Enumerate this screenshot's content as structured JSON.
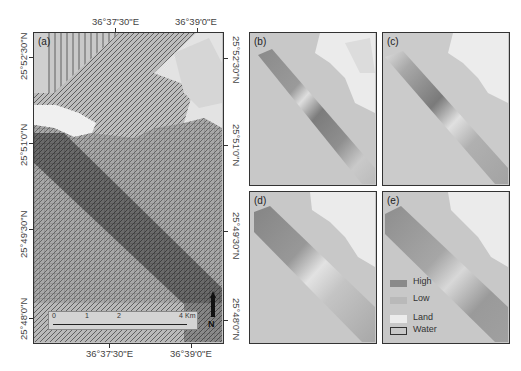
{
  "figure": {
    "panels": [
      {
        "id": "a",
        "label": "(a)"
      },
      {
        "id": "b",
        "label": "(b)"
      },
      {
        "id": "c",
        "label": "(c)"
      },
      {
        "id": "d",
        "label": "(d)"
      },
      {
        "id": "e",
        "label": "(e)"
      }
    ],
    "axes": {
      "top_x_ticks": [
        "36°37'30\"E",
        "36°39'0\"E"
      ],
      "bottom_x_ticks": [
        "36°37'30\"E",
        "36°39'0\"E"
      ],
      "left_y_ticks": [
        "25°52'30\"N",
        "25°51'0\"N",
        "25°49'30\"N",
        "25°48'0\"N"
      ],
      "right_y_ticks": [
        "25°52'30\"N",
        "25°51'0\"N",
        "25°49'30\"N",
        "25°48'0\"N"
      ]
    },
    "scale_bar": {
      "ticks": [
        "0",
        "1",
        "2",
        "4"
      ],
      "unit": "Km"
    },
    "north_arrow": {
      "label": "N"
    },
    "legend": {
      "items": [
        {
          "label": "High",
          "color": "#8a8a8a"
        },
        {
          "label": "Low",
          "color": "#b9b9b9"
        },
        {
          "label": "Land",
          "color": "#ececec"
        },
        {
          "label": "Water",
          "color": "#c8c8c8"
        }
      ]
    },
    "colors": {
      "land": "#ececec",
      "water": "#c6c6c6",
      "strip_high": "#7e7e7e",
      "strip_low": "#d6d6d6",
      "frame": "#333333"
    }
  }
}
